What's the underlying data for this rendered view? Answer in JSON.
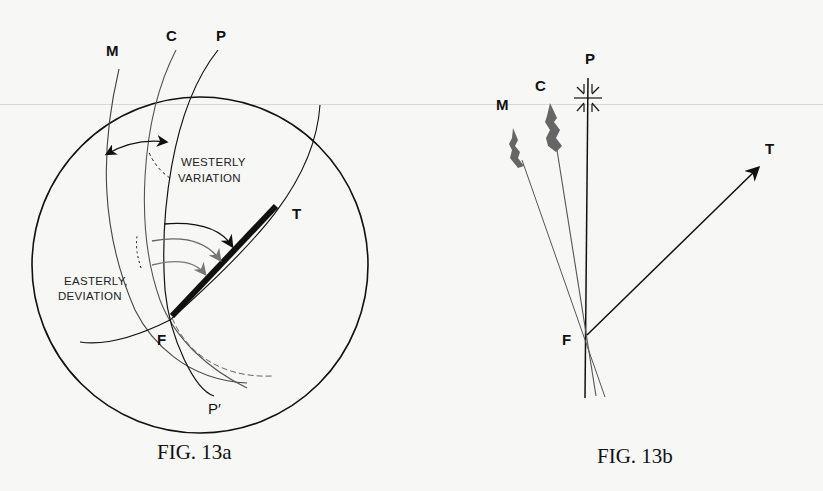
{
  "figures": [
    {
      "id": "fig-13a",
      "caption": "FIG. 13a",
      "labels": {
        "M": "M",
        "C": "C",
        "P": "P",
        "T": "T",
        "F": "F",
        "P_prime": "P′",
        "westerly_1": "WESTERLY",
        "westerly_2": "VARIATION",
        "easterly_1": "EASTERLY,",
        "easterly_2": "DEVIATION"
      }
    },
    {
      "id": "fig-13b",
      "caption": "FIG. 13b",
      "labels": {
        "M": "M",
        "C": "C",
        "P": "P",
        "T": "T",
        "F": "F"
      }
    }
  ],
  "colors": {
    "ink": "#111111",
    "grey_ink": "#555555",
    "paper": "#f7f7f5"
  }
}
